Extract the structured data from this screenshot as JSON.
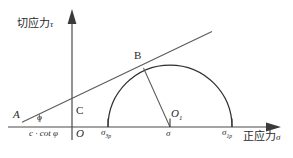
{
  "figure": {
    "type": "mohr-coulomb-failure-envelope-diagram",
    "background_color": "#ffffff",
    "stroke_color": "#3a3a3a",
    "axes": {
      "y_axis_label": "切应力",
      "y_axis_symbol": "τ",
      "x_axis_label": "正应力",
      "x_axis_symbol": "σ",
      "origin_label": "O"
    },
    "points": {
      "A_label": "A",
      "B_label": "B",
      "C_label": "C",
      "O1_label": "O",
      "O1_subscript": "1"
    },
    "angle": {
      "symbol": "φ"
    },
    "intercept": {
      "text": "c · cot φ"
    },
    "ticks": [
      {
        "symbol": "σ",
        "subscript": "3p"
      },
      {
        "symbol": "σ",
        "subscript": ""
      },
      {
        "symbol": "σ",
        "subscript": "1p"
      }
    ]
  },
  "geometry": {
    "axis_y_px": 127,
    "y_axis_x_px": 72,
    "circle_center_x_px": 170,
    "circle_radius_px": 62,
    "tangent_point_B": [
      143,
      68
    ],
    "point_A_x_px": 22
  }
}
